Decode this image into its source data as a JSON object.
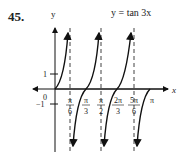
{
  "problem_number": "45.",
  "equation": "y = tan 3x",
  "axes": {
    "x_label": "x",
    "y_label": "y"
  },
  "y_ticks": [
    {
      "label": "1"
    },
    {
      "label": "−1"
    }
  ],
  "origin_label": "0",
  "x_ticks": [
    {
      "num": "π",
      "den": "6"
    },
    {
      "num": "π",
      "den": "3"
    },
    {
      "num": "π",
      "den": "2"
    },
    {
      "num": "2π",
      "den": "3"
    },
    {
      "num": "5π",
      "den": "6"
    },
    {
      "num": "π",
      "den": ""
    }
  ]
}
